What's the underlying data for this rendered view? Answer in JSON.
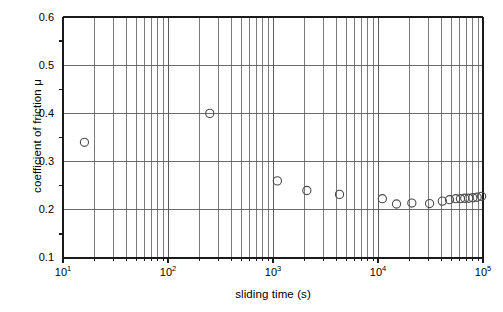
{
  "figure": {
    "background": "#ffffff",
    "axis_color": "#1a1a1a",
    "grid_color": "#5a5a5a",
    "marker_color": "#4a4a4a",
    "marker_fill": "none"
  },
  "axes": {
    "x": {
      "label": "sliding time (s)",
      "scale": "log",
      "min": 10,
      "max": 100000,
      "tick_labels": [
        "10¹",
        "10²",
        "10³",
        "10⁴",
        "10⁵"
      ],
      "tick_mantissa": [
        "10",
        "10",
        "10",
        "10",
        "10"
      ],
      "tick_exponent": [
        "1",
        "2",
        "3",
        "4",
        "5"
      ],
      "minor_ticks": true,
      "grid": true
    },
    "y": {
      "label": "coefficient of friction μ",
      "scale": "linear",
      "min": 0.1,
      "max": 0.6,
      "tick_labels": [
        "0.6",
        "0.5",
        "0.4",
        "0.3",
        "0.2",
        "0.1"
      ],
      "tick_values": [
        0.6,
        0.5,
        0.4,
        0.3,
        0.2,
        0.1
      ],
      "minor_tick_values": [
        0.55,
        0.45,
        0.35,
        0.25,
        0.15
      ],
      "grid": true
    }
  },
  "chart_data": {
    "type": "scatter",
    "title": "",
    "subtitle": "",
    "xlabel": "sliding time (s)",
    "ylabel": "coefficient of friction μ",
    "xscale": "log",
    "yscale": "linear",
    "xlim": [
      10,
      100000
    ],
    "ylim": [
      0.1,
      0.6
    ],
    "grid": true,
    "legend": "none",
    "marker": "open-circle",
    "series": [
      {
        "name": "coefficient of friction",
        "x": [
          16,
          250,
          1100,
          2100,
          4300,
          11000,
          15000,
          21000,
          31000,
          41000,
          48000,
          55000,
          61000,
          67000,
          73000,
          80000,
          88000,
          97000
        ],
        "y": [
          0.34,
          0.4,
          0.26,
          0.24,
          0.232,
          0.223,
          0.212,
          0.214,
          0.213,
          0.218,
          0.221,
          0.223,
          0.223,
          0.224,
          0.224,
          0.225,
          0.226,
          0.228
        ]
      }
    ]
  }
}
